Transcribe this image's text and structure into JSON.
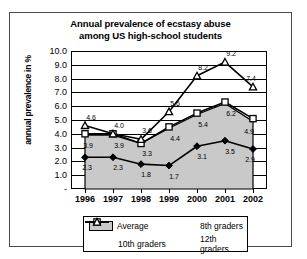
{
  "chart_data": {
    "type": "line",
    "title": "Annual prevalence of ecstasy abuse among US high-school students",
    "title_line1": "Annual prevalence of ecstasy abuse",
    "title_line2": "among US high-school students",
    "xlabel": "",
    "ylabel": "annual prevalence in %",
    "categories": [
      "1996",
      "1997",
      "1998",
      "1999",
      "2000",
      "2001",
      "2002"
    ],
    "ylim": [
      0,
      10
    ],
    "yticks": [
      "-",
      "1.0",
      "2.0",
      "3.0",
      "4.0",
      "5.0",
      "6.0",
      "7.0",
      "8.0",
      "9.0",
      "10.0"
    ],
    "grid": true,
    "legend_position": "bottom",
    "series": [
      {
        "name": "Average",
        "type": "area",
        "color": "#c9c9c9",
        "values": [
          3.9,
          3.9,
          3.3,
          4.4,
          5.4,
          6.2,
          4.9
        ],
        "labels": [
          "3.9",
          "3.9",
          "3.3",
          "4.4",
          "5.4",
          "6.2",
          "4.9"
        ]
      },
      {
        "name": "8th graders",
        "type": "line",
        "marker": "filled-diamond",
        "color": "#000000",
        "values": [
          2.3,
          2.3,
          1.8,
          1.7,
          3.1,
          3.5,
          2.9
        ],
        "labels": [
          "2.3",
          "2.3",
          "1.8",
          "1.7",
          "3.1",
          "3.5",
          "2.9"
        ]
      },
      {
        "name": "10th graders",
        "type": "line",
        "marker": "open-square",
        "color": "#000000",
        "values": [
          4.0,
          4.0,
          3.3,
          4.5,
          5.5,
          6.3,
          5.1
        ],
        "labels": [
          "",
          "",
          "",
          "",
          "",
          "",
          ""
        ]
      },
      {
        "name": "12th graders",
        "type": "line",
        "marker": "open-triangle",
        "color": "#000000",
        "values": [
          4.6,
          4.0,
          3.6,
          5.6,
          8.2,
          9.2,
          7.4
        ],
        "labels": [
          "4.6",
          "4.0",
          "3.6",
          "5.6",
          "8.2",
          "9.2",
          "7.4"
        ]
      }
    ]
  },
  "legend": {
    "average": "Average",
    "eighth": "8th graders",
    "tenth": "10th graders",
    "twelfth": "12th graders"
  }
}
